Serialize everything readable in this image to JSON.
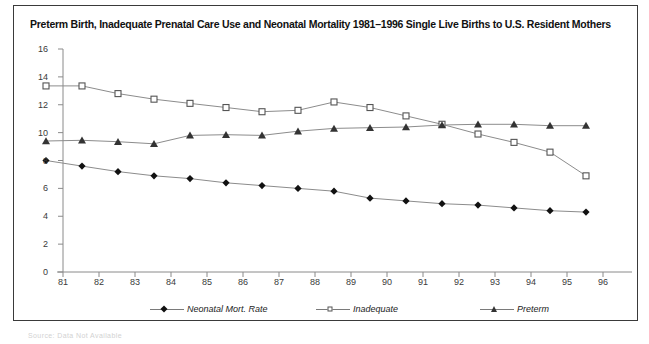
{
  "title": "Preterm Birth, Inadequate Prenatal Care Use and Neonatal Mortality 1981–1996 Single Live Births to U.S. Resident Mothers",
  "source_note": "Source: Data Not Available",
  "legend": {
    "neonatal_label": "Neonatal Mort. Rate",
    "inadequate_label": "Inadequate",
    "preterm_label": "Preterm"
  },
  "chart_data": {
    "type": "line",
    "title": "Preterm Birth, Inadequate Prenatal Care Use and Neonatal Mortality 1981–1996 Single Live Births to U.S. Resident Mothers",
    "xlabel": "",
    "ylabel": "",
    "xlim": [
      81,
      96
    ],
    "ylim": [
      0,
      16
    ],
    "yticks": [
      0,
      2,
      4,
      6,
      8,
      10,
      12,
      14,
      16
    ],
    "xticks": [
      81,
      82,
      83,
      84,
      85,
      86,
      87,
      88,
      89,
      90,
      91,
      92,
      93,
      94,
      95,
      96
    ],
    "grid": false,
    "legend_position": "bottom",
    "x": [
      81,
      82,
      83,
      84,
      85,
      86,
      87,
      88,
      89,
      90,
      91,
      92,
      93,
      94,
      95,
      96
    ],
    "series": [
      {
        "name": "Neonatal Mort. Rate",
        "marker": "diamond-filled",
        "color": "#111111",
        "values": [
          8.0,
          7.6,
          7.2,
          6.9,
          6.7,
          6.4,
          6.2,
          6.0,
          5.8,
          5.3,
          5.1,
          4.9,
          4.8,
          4.6,
          4.4,
          4.3
        ]
      },
      {
        "name": "Inadequate",
        "marker": "square-open",
        "color": "#555555",
        "values": [
          13.35,
          13.35,
          12.8,
          12.4,
          12.1,
          11.8,
          11.5,
          11.6,
          12.2,
          11.8,
          11.2,
          10.6,
          9.9,
          9.3,
          8.6,
          6.9
        ]
      },
      {
        "name": "Preterm",
        "marker": "triangle-filled",
        "color": "#333333",
        "values": [
          9.4,
          9.45,
          9.35,
          9.2,
          9.8,
          9.85,
          9.8,
          10.1,
          10.3,
          10.35,
          10.4,
          10.55,
          10.6,
          10.6,
          10.5,
          10.5
        ]
      }
    ]
  }
}
